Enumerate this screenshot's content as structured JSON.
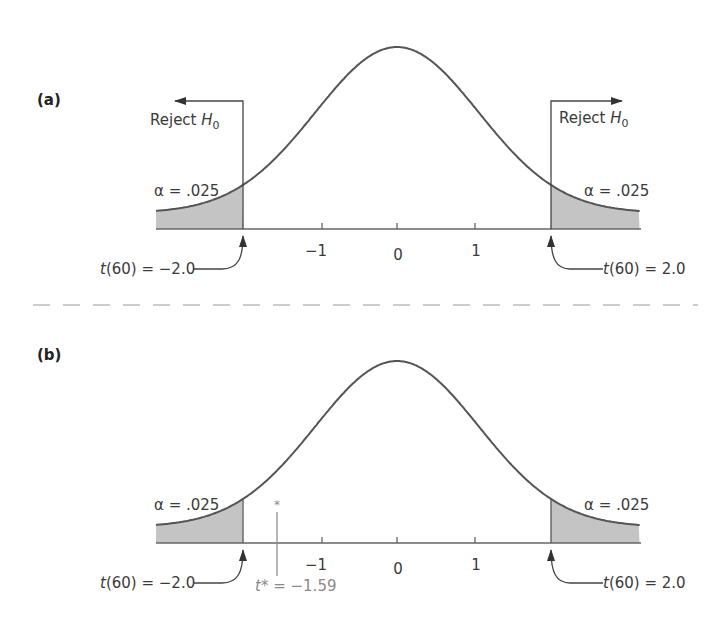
{
  "figure": {
    "panels": [
      {
        "id": "a",
        "label": "(a)",
        "reject_left": {
          "text": "Reject ",
          "subject": "H",
          "sub": "0"
        },
        "reject_right": {
          "text": "Reject ",
          "subject": "H",
          "sub": "0"
        },
        "alpha_left": "α = .025",
        "alpha_right": "α = .025",
        "crit_left": {
          "t": "t",
          "rest": "(60) = −2.0"
        },
        "crit_right": {
          "t": "t",
          "rest": "(60) = 2.0"
        },
        "ticks": [
          "−1",
          "0",
          "1"
        ]
      },
      {
        "id": "b",
        "label": "(b)",
        "alpha_left": "α = .025",
        "alpha_right": "α = .025",
        "crit_left": {
          "t": "t",
          "rest": "(60) = −2.0"
        },
        "crit_right": {
          "t": "t",
          "rest": "(60) = 2.0"
        },
        "ticks": [
          "−1",
          "0",
          "1"
        ],
        "observed": {
          "marker": "*",
          "t": "t",
          "rest": "* = −1.59"
        }
      }
    ]
  },
  "chart_data": [
    {
      "type": "area",
      "title": "(a) Two-tailed t-test rejection regions",
      "distribution": "t",
      "df": 60,
      "x_ticks": [
        -1,
        0,
        1
      ],
      "critical_values": [
        -2.0,
        2.0
      ],
      "alpha_per_tail": 0.025,
      "shaded_regions": [
        [
          -3.1,
          -2.0
        ],
        [
          2.0,
          3.1
        ]
      ],
      "annotations": [
        "Reject H0 (left arrow from t = -2.0)",
        "Reject H0 (right arrow from t = 2.0)",
        "α = .025",
        "α = .025",
        "t(60) = −2.0",
        "t(60) = 2.0"
      ],
      "grid": false
    },
    {
      "type": "area",
      "title": "(b) Observed t* falls outside rejection region",
      "distribution": "t",
      "df": 60,
      "x_ticks": [
        -1,
        0,
        1
      ],
      "critical_values": [
        -2.0,
        2.0
      ],
      "alpha_per_tail": 0.025,
      "shaded_regions": [
        [
          -3.1,
          -2.0
        ],
        [
          2.0,
          3.1
        ]
      ],
      "observed_t": -1.59,
      "annotations": [
        "α = .025",
        "α = .025",
        "t(60) = −2.0",
        "t(60) = 2.0",
        "t* = −1.59"
      ],
      "grid": false
    }
  ]
}
